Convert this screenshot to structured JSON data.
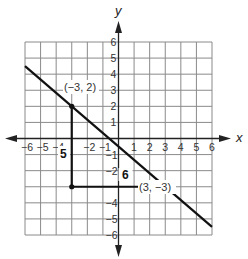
{
  "figure": {
    "type": "coordinate-plane",
    "axes": {
      "x_label": "x",
      "y_label": "y",
      "x_range": [
        -6,
        6
      ],
      "y_range": [
        -6,
        6
      ],
      "x_ticks": [
        "−6",
        "−5",
        "−4",
        "−2",
        "−1",
        "1",
        "2",
        "3",
        "4",
        "5",
        "6"
      ],
      "x_tick_values": [
        -6,
        -5,
        -4,
        -2,
        -1,
        1,
        2,
        3,
        4,
        5,
        6
      ],
      "y_ticks": [
        "6",
        "5",
        "4",
        "3",
        "2",
        "1",
        "−1",
        "−2",
        "−4",
        "−5",
        "−6"
      ],
      "y_tick_values": [
        6,
        5,
        4,
        3,
        2,
        1,
        -1,
        -2,
        -4,
        -5,
        -6
      ]
    },
    "line": {
      "from": [
        -6,
        4.5
      ],
      "to": [
        6,
        -5.5
      ],
      "slope": "-5/6"
    },
    "points": [
      {
        "label": "(−3, 2)",
        "x": -3,
        "y": 2
      },
      {
        "label": "(3, −3)",
        "x": 3,
        "y": -3
      }
    ],
    "triangle": {
      "vertices": [
        [
          -3,
          2
        ],
        [
          -3,
          -3
        ],
        [
          3,
          -3
        ]
      ],
      "vertical_leg_label": "5",
      "horizontal_leg_label": "6"
    },
    "colors": {
      "grid": "#7a7a7a",
      "axis": "#222222",
      "line": "#111111",
      "background": "#ffffff"
    }
  }
}
